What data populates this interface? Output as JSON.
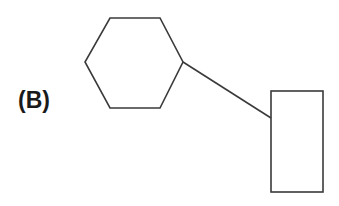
{
  "figure": {
    "panel_label": "(B)",
    "background_color": "#ffffff",
    "stroke_color": "#3a3a3a",
    "stroke_width": 1.6,
    "canvas": {
      "width": 339,
      "height": 206
    },
    "shapes": {
      "hexagon": {
        "name": "hexagon",
        "points": "110,18 160,18 183,62 160,108 110,108 85,62",
        "center": {
          "x": 134,
          "y": 63
        }
      },
      "rectangle": {
        "name": "rectangle",
        "x": 271,
        "y": 91,
        "width": 52,
        "height": 101
      },
      "connector": {
        "name": "connecting-line",
        "x1": 183,
        "y1": 62,
        "x2": 271,
        "y2": 118
      }
    }
  }
}
